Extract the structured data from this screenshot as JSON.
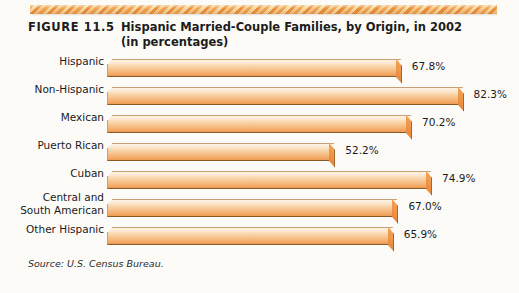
{
  "figure": {
    "label": "FIGURE 11.5",
    "title_line1": "Hispanic Married-Couple Families, by Origin, in 2002",
    "title_line2": "(in percentages)",
    "source": "Source: U.S. Census Bureau."
  },
  "decoration": {
    "top_band": "zigzag-band",
    "band_colors": [
      "#f0a24a",
      "#fbd9a0",
      "#ea8f36",
      "#fcc887"
    ]
  },
  "colors": {
    "bar_front_light": "#fae2c4",
    "bar_front_mid": "#f3ac6b",
    "bar_top": "#fdf3e4",
    "bar_cap": "#ee9447",
    "text": "#1a1a1a",
    "background": "#fdfbf8"
  },
  "chart_data": {
    "type": "bar",
    "orientation": "horizontal",
    "title": "Hispanic Married-Couple Families, by Origin, in 2002 (in percentages)",
    "xlabel": "",
    "ylabel": "",
    "xlim": [
      0,
      90
    ],
    "grid": false,
    "legend": null,
    "value_suffix": "%",
    "categories": [
      "Hispanic",
      "Non-Hispanic",
      "Mexican",
      "Puerto Rican",
      "Cuban",
      "Central and\nSouth American",
      "Other Hispanic"
    ],
    "values": [
      67.8,
      82.3,
      70.2,
      52.2,
      74.9,
      67.0,
      65.9
    ],
    "value_labels": [
      "67.8%",
      "82.3%",
      "70.2%",
      "52.2%",
      "74.9%",
      "67.0%",
      "65.9%"
    ],
    "source": "Source: U.S. Census Bureau."
  }
}
